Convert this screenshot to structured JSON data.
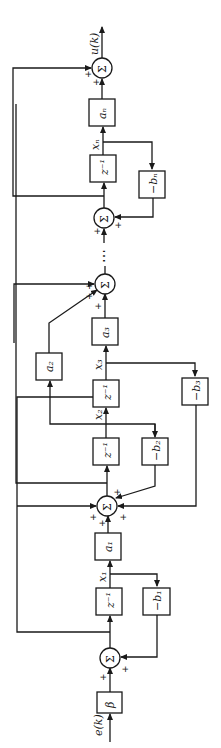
{
  "diagram": {
    "title": "",
    "orientation": "rotated 90° counter-clockwise (signal flows bottom to top)",
    "input_label": "e(k)",
    "output_label": "u(k)",
    "blocks": {
      "beta": "β",
      "z1": "z⁻¹",
      "z2": "z⁻¹",
      "z3": "z⁻¹",
      "zn": "z⁻¹",
      "a1": "a₁",
      "a2": "a₂",
      "a3": "a₃",
      "an": "aₙ",
      "b1": "−b₁",
      "b2": "−b₂",
      "b3": "−b₃",
      "bn": "−bₙ"
    },
    "summers": {
      "symbol": "Σ",
      "plus": "+"
    },
    "states": {
      "x1": "x₁",
      "x2": "x₂",
      "x3": "x₃",
      "xn": "xₙ"
    },
    "ellipsis": "⋯"
  }
}
